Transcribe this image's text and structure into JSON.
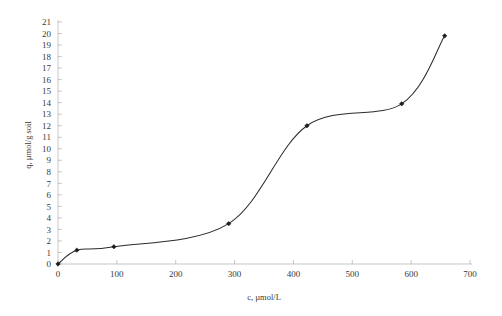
{
  "chart_data": {
    "type": "line",
    "title": "",
    "subtitle": "",
    "xlabel": "c, µmol/L",
    "ylabel": "q, µmol/g soil",
    "xlim": [
      0,
      700
    ],
    "ylim": [
      0,
      21
    ],
    "xticks": [
      0,
      100,
      200,
      300,
      400,
      500,
      600,
      700
    ],
    "yticks": [
      0,
      1,
      2,
      3,
      4,
      5,
      6,
      7,
      8,
      9,
      10,
      11,
      12,
      13,
      14,
      15,
      16,
      17,
      18,
      19,
      20,
      21
    ],
    "grid": false,
    "legend": null,
    "marker": "diamond",
    "line_color": "#2b2b2b",
    "marker_color": "#1c1c1c",
    "smoothing": "spline",
    "series": [
      {
        "name": "sorption isotherm",
        "x": [
          0,
          32,
          95,
          290,
          423,
          584,
          657
        ],
        "y": [
          0,
          1.2,
          1.5,
          3.5,
          12.0,
          13.9,
          19.8
        ]
      }
    ]
  },
  "axes": {
    "x_tick_labels": [
      "0",
      "100",
      "200",
      "300",
      "400",
      "500",
      "600",
      "700"
    ],
    "y_tick_labels": [
      "0",
      "1",
      "2",
      "3",
      "4",
      "5",
      "6",
      "7",
      "8",
      "9",
      "10",
      "11",
      "12",
      "13",
      "14",
      "15",
      "16",
      "17",
      "18",
      "19",
      "20",
      "21"
    ],
    "x_axis_title": "c, µmol/L",
    "y_axis_title": "q, µmol/g soil"
  },
  "colors": {
    "background": "#ffffff",
    "axis": "#b9b9b9",
    "text": "#3a3a3a",
    "series": "#2b2b2b"
  }
}
